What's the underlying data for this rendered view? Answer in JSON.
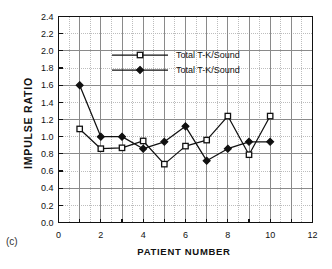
{
  "figure": {
    "panel_letter": "(c)",
    "background_color": "#ffffff"
  },
  "chart_data": {
    "type": "line",
    "title": "",
    "subtitle": "",
    "xlabel": "PATIENT NUMBER",
    "ylabel": "IMPULSE  RATIO",
    "xlim": [
      0,
      12
    ],
    "ylim": [
      0.0,
      2.4
    ],
    "x_tick_labels": [
      "0",
      "2",
      "4",
      "6",
      "8",
      "10",
      "12"
    ],
    "x_ticks": [
      0,
      2,
      4,
      6,
      8,
      10,
      12
    ],
    "x_minor_ticks": [
      1,
      3,
      5,
      7,
      9,
      11
    ],
    "y_tick_labels": [
      "0.0",
      "0.2",
      "0.4",
      "0.6",
      "0.8",
      "1.0",
      "1.2",
      "1.4",
      "1.6",
      "1.8",
      "2.0",
      "2.2",
      "2.4"
    ],
    "y_ticks": [
      0.0,
      0.2,
      0.4,
      0.6,
      0.8,
      1.0,
      1.2,
      1.4,
      1.6,
      1.8,
      2.0,
      2.2,
      2.4
    ],
    "grid": true,
    "grid_major_color": "#8a8a8a",
    "grid_minor_color": "#bdbdbd",
    "legend_position": "upper-center",
    "x": [
      1,
      2,
      3,
      4,
      5,
      6,
      7,
      8,
      9,
      10
    ],
    "series": [
      {
        "name": "Total T-K/Sound",
        "marker": "open-square",
        "color": "#111111",
        "values": [
          1.09,
          0.86,
          0.87,
          0.95,
          0.68,
          0.89,
          0.96,
          1.24,
          0.79,
          1.24
        ]
      },
      {
        "name": "Total T-K/Sound",
        "marker": "filled-diamond",
        "color": "#111111",
        "values": [
          1.6,
          1.0,
          1.0,
          0.86,
          0.94,
          1.12,
          0.72,
          0.86,
          0.94,
          0.94
        ]
      }
    ]
  },
  "legend": {
    "entries": [
      {
        "label": "Total T-K/Sound",
        "marker": "open-square"
      },
      {
        "label": "Total T-K/Sound",
        "marker": "filled-diamond"
      }
    ]
  }
}
